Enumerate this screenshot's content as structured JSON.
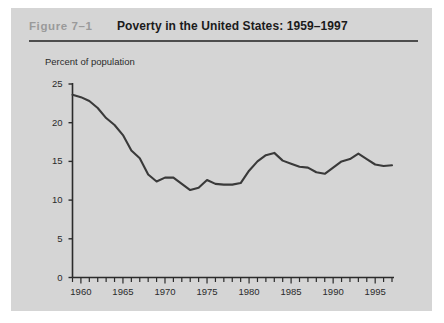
{
  "figure": {
    "label": "Figure  7–1",
    "title": "Poverty in the United States: 1959–1997",
    "panel_color": "#d5d5d5",
    "label_color": "#9a9a9a",
    "rule_color": "#4d4d4d"
  },
  "chart_data": {
    "type": "line",
    "title": "Poverty in the United States: 1959–1997",
    "xlabel": "",
    "ylabel": "Percent of population",
    "axis_color": "#2b2b2b",
    "line_color": "#3a3a3a",
    "grid": false,
    "legend": null,
    "xlim": [
      1959,
      1997
    ],
    "ylim": [
      0,
      25
    ],
    "ytick_labels": [
      "0",
      "5",
      "10",
      "15",
      "20",
      "25"
    ],
    "yticks": [
      0,
      5,
      10,
      15,
      20,
      25
    ],
    "xtick_labels": [
      "1960",
      "1965",
      "1970",
      "1975",
      "1980",
      "1985",
      "1990",
      "1995"
    ],
    "xticks": [
      1960,
      1965,
      1970,
      1975,
      1980,
      1985,
      1990,
      1995
    ],
    "minor_xtick_interval": 1,
    "x": [
      1959,
      1960,
      1961,
      1962,
      1963,
      1964,
      1965,
      1966,
      1967,
      1968,
      1969,
      1970,
      1971,
      1972,
      1973,
      1974,
      1975,
      1976,
      1977,
      1978,
      1979,
      1980,
      1981,
      1982,
      1983,
      1984,
      1985,
      1986,
      1987,
      1988,
      1989,
      1990,
      1991,
      1992,
      1993,
      1994,
      1995,
      1996,
      1997
    ],
    "values": [
      23.6,
      23.3,
      22.8,
      21.9,
      20.6,
      19.7,
      18.4,
      16.4,
      15.4,
      13.3,
      12.4,
      12.9,
      12.9,
      12.1,
      11.3,
      11.6,
      12.6,
      12.1,
      12.0,
      12.0,
      12.2,
      13.8,
      15.0,
      15.8,
      16.1,
      15.1,
      14.7,
      14.3,
      14.2,
      13.6,
      13.4,
      14.2,
      15.0,
      15.3,
      16.0,
      15.3,
      14.6,
      14.4,
      14.5
    ],
    "series_name": "Poverty rate"
  }
}
